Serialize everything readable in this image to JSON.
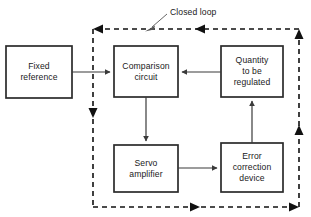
{
  "diagram": {
    "title_annotation": "Closed loop",
    "stroke_color": "#3a3a3a",
    "box_stroke_color": "#2b2b2b",
    "background_color": "#ffffff",
    "boxes": [
      {
        "id": "fixed-reference",
        "label": "Fixed\nreference",
        "x": 6,
        "y": 46,
        "w": 66,
        "h": 52
      },
      {
        "id": "comparison-circuit",
        "label": "Comparison\ncircuit",
        "x": 114,
        "y": 46,
        "w": 64,
        "h": 51
      },
      {
        "id": "quantity-to-be-regulated",
        "label": "Quantity\nto be\nregulated",
        "x": 221,
        "y": 46,
        "w": 62,
        "h": 51
      },
      {
        "id": "servo-amplifier",
        "label": "Servo\namplifier",
        "x": 114,
        "y": 145,
        "w": 64,
        "h": 47
      },
      {
        "id": "error-correction-device",
        "label": "Error\ncorrection\ndevice",
        "x": 221,
        "y": 143,
        "w": 62,
        "h": 49
      }
    ],
    "connections": [
      {
        "id": "fixed-reference-to-comparison-circuit",
        "from": "fixed-reference",
        "to": "comparison-circuit"
      },
      {
        "id": "quantity-to-comparison-circuit",
        "from": "quantity-to-be-regulated",
        "to": "comparison-circuit"
      },
      {
        "id": "comparison-circuit-to-servo-amplifier",
        "from": "comparison-circuit",
        "to": "servo-amplifier"
      },
      {
        "id": "servo-amplifier-to-error-correction",
        "from": "servo-amplifier",
        "to": "error-correction-device"
      },
      {
        "id": "error-correction-to-quantity",
        "from": "error-correction-device",
        "to": "quantity-to-be-regulated"
      }
    ],
    "closed_loop": {
      "label": "Closed loop",
      "x": 93,
      "y": 29,
      "w": 206,
      "h": 178,
      "dashed": true
    }
  }
}
